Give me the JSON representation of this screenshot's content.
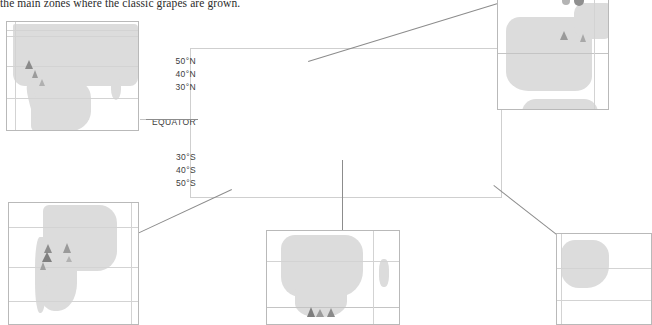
{
  "caption": {
    "text": "the main zones where the classic grapes are grown."
  },
  "map": {
    "title": "World wine regions map",
    "type": "world-locator-map",
    "projection": "equirectangular",
    "land_color": "#dcdcdc",
    "sea_color": "#ffffff",
    "graticule_color": "#d3d3d3",
    "callout_border_color": "#8c8c8c",
    "latitude_labels": [
      {
        "id": "lat-50n",
        "label": "50°N",
        "value": 50
      },
      {
        "id": "lat-40n",
        "label": "40°N",
        "value": 40
      },
      {
        "id": "lat-30n",
        "label": "30°N",
        "value": 30
      },
      {
        "id": "lat-eq",
        "label": "EQUATOR",
        "value": 0
      },
      {
        "id": "lat-30s",
        "label": "30°S",
        "value": -30
      },
      {
        "id": "lat-40s",
        "label": "40°S",
        "value": -40
      },
      {
        "id": "lat-50s",
        "label": "50°S",
        "value": -50
      }
    ],
    "callouts": [
      {
        "id": "callout-north-america",
        "region": "North America / West Coast"
      },
      {
        "id": "callout-europe",
        "region": "Europe / Iberia"
      },
      {
        "id": "callout-south-america",
        "region": "South America / Chile"
      },
      {
        "id": "callout-southern-africa",
        "region": "Southern Africa"
      },
      {
        "id": "callout-australia",
        "region": "Australia"
      }
    ]
  },
  "insets": {
    "north_america": {
      "name": "North America inset",
      "markers": [
        {
          "type": "triangle",
          "color": "#8a8a8a"
        },
        {
          "type": "triangle",
          "color": "#9c9c9c"
        },
        {
          "type": "triangle",
          "color": "#b0b0b0"
        }
      ]
    },
    "iberia": {
      "name": "Iberian Peninsula inset",
      "markers": [
        {
          "type": "triangle",
          "color": "#9a9a9a"
        },
        {
          "type": "triangle",
          "color": "#a8a8a8"
        },
        {
          "type": "circle",
          "color": "#b4b4b4"
        },
        {
          "type": "circle",
          "color": "#8f8f8f"
        }
      ]
    },
    "south_america": {
      "name": "Chile and Argentina inset",
      "markers": [
        {
          "type": "triangle",
          "color": "#8d8d8d"
        },
        {
          "type": "triangle",
          "color": "#7f7f7f"
        },
        {
          "type": "triangle",
          "color": "#a0a0a0"
        },
        {
          "type": "triangle",
          "color": "#9a9a9a"
        },
        {
          "type": "triangle",
          "color": "#b2b2b2"
        }
      ]
    },
    "southern_africa": {
      "name": "Southern Africa inset",
      "markers": [
        {
          "type": "triangle",
          "color": "#7e7e7e"
        },
        {
          "type": "triangle",
          "color": "#9b9b9b"
        },
        {
          "type": "triangle",
          "color": "#8a8a8a"
        }
      ]
    },
    "australia": {
      "name": "Australia inset",
      "markers": []
    }
  }
}
